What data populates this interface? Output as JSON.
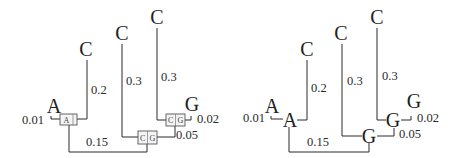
{
  "left_tree": {
    "leaves": {
      "c1": "C",
      "c2": "C",
      "c3": "C",
      "g": "G",
      "a": "A"
    },
    "branch_lengths": {
      "a": "0.01",
      "c1": "0.2",
      "c2": "0.3",
      "c3": "0.3",
      "g": "0.02",
      "inner_cg": "0.05",
      "root_a": "0.15"
    },
    "node_boxes": {
      "a_node": [
        "A"
      ],
      "cg_upper": [
        "C",
        "G"
      ],
      "cg_lower": [
        "C",
        "G"
      ]
    }
  },
  "right_tree": {
    "leaves": {
      "c1": "C",
      "c2": "C",
      "c3": "C",
      "g": "G",
      "a": "A"
    },
    "internal_nodes": {
      "a_node": "A",
      "g_upper": "G",
      "g_lower": "G"
    },
    "branch_lengths": {
      "a": "0.01",
      "c1": "0.2",
      "c2": "0.3",
      "c3": "0.3",
      "g": "0.02",
      "inner_g": "0.05",
      "root_a": "0.15"
    }
  }
}
